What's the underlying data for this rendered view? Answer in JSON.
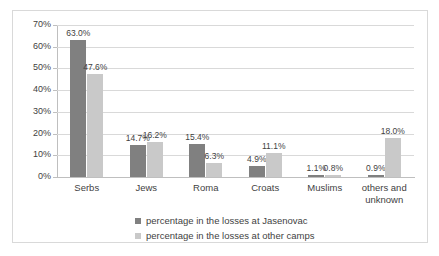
{
  "chart_data": {
    "type": "bar",
    "title": "",
    "subtitle": "",
    "xlabel": "",
    "ylabel": "",
    "categories": [
      "Serbs",
      "Jews",
      "Roma",
      "Croats",
      "Muslims",
      "others and unknown"
    ],
    "series": [
      {
        "name": "percentage in the losses at Jasenovac",
        "color": "#808080",
        "values": [
          63.0,
          14.7,
          15.4,
          4.9,
          1.1,
          0.9
        ],
        "labels": [
          "63.0%",
          "14.7%",
          "15.4%",
          "4.9%",
          "1.1%",
          "0.9%"
        ]
      },
      {
        "name": "percentage in the losses at other camps",
        "color": "#c9c9c9",
        "values": [
          47.6,
          16.2,
          6.3,
          11.1,
          0.8,
          18.0
        ],
        "labels": [
          "47.6%",
          "16.2%",
          "6.3%",
          "11.1%",
          "0.8%",
          "18.0%"
        ]
      }
    ],
    "ylim": [
      0,
      70
    ],
    "ytick_values": [
      0,
      10,
      20,
      30,
      40,
      50,
      60,
      70
    ],
    "ytick_labels": [
      "0%",
      "10%",
      "20%",
      "30%",
      "40%",
      "50%",
      "60%",
      "70%"
    ],
    "grid": true,
    "legend_position": "bottom"
  },
  "legend": {
    "entries": [
      "percentage in the losses at Jasenovac",
      "percentage in the losses at other camps"
    ]
  }
}
